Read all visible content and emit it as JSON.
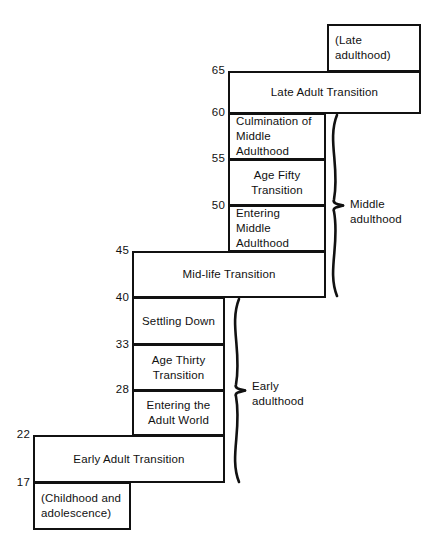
{
  "diagram": {
    "axis_ticks": [
      {
        "value": "65",
        "x": 205,
        "y": 64
      },
      {
        "value": "60",
        "x": 205,
        "y": 106
      },
      {
        "value": "55",
        "x": 205,
        "y": 152
      },
      {
        "value": "50",
        "x": 205,
        "y": 199
      },
      {
        "value": "45",
        "x": 109,
        "y": 244
      },
      {
        "value": "40",
        "x": 109,
        "y": 291
      },
      {
        "value": "33",
        "x": 109,
        "y": 338
      },
      {
        "value": "28",
        "x": 109,
        "y": 383
      },
      {
        "value": "22",
        "x": 10,
        "y": 428
      },
      {
        "value": "17",
        "x": 10,
        "y": 476
      }
    ],
    "boxes": [
      {
        "name": "late-adulthood",
        "label": "(Late adulthood)",
        "align": "left",
        "x": 327,
        "y": 24,
        "w": 94,
        "h": 48
      },
      {
        "name": "late-adult-transition",
        "label": "Late Adult Transition",
        "align": "center",
        "x": 228,
        "y": 71,
        "w": 193,
        "h": 43
      },
      {
        "name": "culmination-of-middle-adulthood",
        "label": "Culmination of\nMiddle Adulthood",
        "align": "left",
        "x": 228,
        "y": 113,
        "w": 98,
        "h": 47
      },
      {
        "name": "age-fifty-transition",
        "label": "Age Fifty\nTransition",
        "align": "center",
        "x": 228,
        "y": 159,
        "w": 98,
        "h": 47
      },
      {
        "name": "entering-middle-adulthood",
        "label": "Entering\nMiddle Adulthood",
        "align": "left",
        "x": 228,
        "y": 205,
        "w": 98,
        "h": 47
      },
      {
        "name": "mid-life-transition",
        "label": "Mid-life Transition",
        "align": "center",
        "x": 132,
        "y": 251,
        "w": 194,
        "h": 47
      },
      {
        "name": "settling-down",
        "label": "Settling Down",
        "align": "center",
        "x": 132,
        "y": 297,
        "w": 93,
        "h": 48
      },
      {
        "name": "age-thirty-transition",
        "label": "Age Thirty\nTransition",
        "align": "center",
        "x": 132,
        "y": 344,
        "w": 93,
        "h": 47
      },
      {
        "name": "entering-the-adult-world",
        "label": "Entering the\nAdult World",
        "align": "center",
        "x": 132,
        "y": 390,
        "w": 93,
        "h": 46
      },
      {
        "name": "early-adult-transition",
        "label": "Early Adult Transition",
        "align": "center",
        "x": 33,
        "y": 435,
        "w": 192,
        "h": 48
      },
      {
        "name": "childhood-and-adolescence",
        "label": "(Childhood and\nadolescence)",
        "align": "left",
        "x": 33,
        "y": 482,
        "w": 98,
        "h": 48
      }
    ],
    "braces": [
      {
        "name": "middle-adulthood",
        "label": "Middle\nadulthood",
        "label_x": 350,
        "label_y": 197,
        "top": 115,
        "bottom": 296,
        "x": 336
      },
      {
        "name": "early-adulthood",
        "label": "Early\nadulthood",
        "label_x": 252,
        "label_y": 379,
        "top": 299,
        "bottom": 482,
        "x": 238
      }
    ]
  }
}
